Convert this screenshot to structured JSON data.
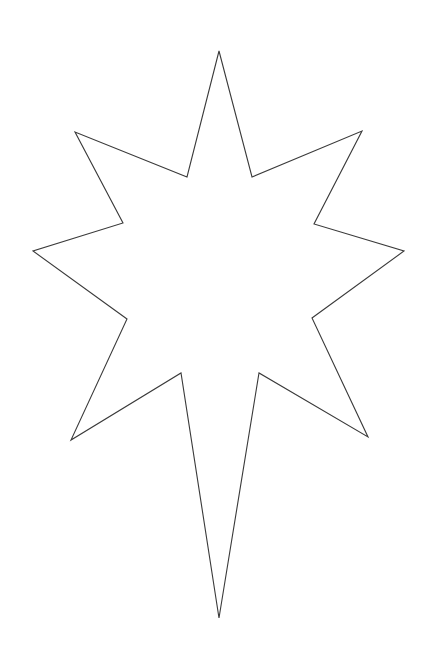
{
  "document": {
    "title": "Eight-Pointed Star Outline",
    "type": "line-drawing",
    "canvas": {
      "width": 437,
      "height": 649,
      "background_color": "#ffffff"
    }
  },
  "shape": {
    "name": "eight-pointed-star",
    "description": "Eight-pointed star outline with an elongated lower point",
    "stroke_color": "#3a3a3a",
    "fill_color": "#ffffff",
    "stroke_width": 1.1,
    "point_count": 8,
    "outer_tips": [
      {
        "label": "top",
        "x": 219,
        "y": 51
      },
      {
        "label": "upper-right",
        "x": 362,
        "y": 131
      },
      {
        "label": "right",
        "x": 404,
        "y": 251
      },
      {
        "label": "lower-right",
        "x": 368,
        "y": 437
      },
      {
        "label": "bottom",
        "x": 219,
        "y": 618
      },
      {
        "label": "lower-left",
        "x": 71,
        "y": 440
      },
      {
        "label": "left",
        "x": 33,
        "y": 251
      },
      {
        "label": "upper-left",
        "x": 75,
        "y": 132
      }
    ],
    "inner_vertices": [
      {
        "label": "top-right-notch",
        "x": 252,
        "y": 177
      },
      {
        "label": "right-upper-notch",
        "x": 314,
        "y": 224
      },
      {
        "label": "right-lower-notch",
        "x": 312,
        "y": 318
      },
      {
        "label": "bottom-right-notch",
        "x": 259,
        "y": 373
      },
      {
        "label": "bottom-left-notch",
        "x": 181,
        "y": 373
      },
      {
        "label": "left-lower-notch",
        "x": 127,
        "y": 319
      },
      {
        "label": "left-upper-notch",
        "x": 123,
        "y": 223
      },
      {
        "label": "top-left-notch",
        "x": 187,
        "y": 177
      }
    ],
    "path_points": "219,51 252,177 362,131 314,224 404,251 312,318 368,437 259,373 219,618 181,373 71,440 127,319 33,251 123,223 75,132 187,177"
  }
}
